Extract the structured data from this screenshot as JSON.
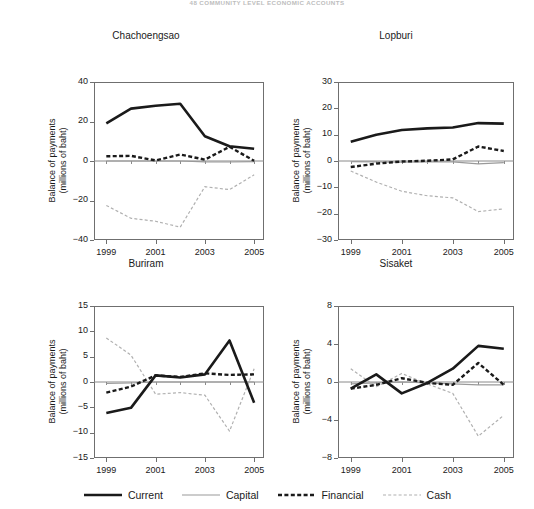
{
  "page": {
    "running_header": "48   COMMUNITY LEVEL ECONOMIC ACCOUNTS"
  },
  "legend": {
    "items": [
      {
        "label": "Current",
        "key": "current",
        "color": "#1a1a1a",
        "width": 2.6,
        "dash": "none",
        "name": "legend-item-current"
      },
      {
        "label": "Capital",
        "key": "capital",
        "color": "#9a9a9a",
        "width": 1.2,
        "dash": "none",
        "name": "legend-item-capital"
      },
      {
        "label": "Financial",
        "key": "financial",
        "color": "#1a1a1a",
        "width": 2.4,
        "dash": "4,2.4",
        "name": "legend-item-financial"
      },
      {
        "label": "Cash",
        "key": "cash",
        "color": "#b0b0b0",
        "width": 1.2,
        "dash": "3,2.2",
        "name": "legend-item-cash"
      }
    ]
  },
  "chart_data": [
    {
      "id": "chachoengsao",
      "type": "line",
      "title": "Chachoengsao",
      "xlabel": "",
      "ylabel": "Balance of payments\n(millions of baht)",
      "ylabel_line1": "Balance of payments",
      "ylabel_line2": "(millions of baht)",
      "x": [
        1999,
        2000,
        2001,
        2002,
        2003,
        2004,
        2005
      ],
      "xticks": [
        1999,
        2001,
        2003,
        2005
      ],
      "xlim": [
        1998.5,
        2005.4
      ],
      "ylim": [
        -40,
        40
      ],
      "yticks": [
        40,
        20,
        0,
        -20,
        -40
      ],
      "grid": false,
      "series": [
        {
          "name": "Current",
          "key": "current",
          "values": [
            19.0,
            26.5,
            28.0,
            29.0,
            12.5,
            7.5,
            6.2
          ]
        },
        {
          "name": "Capital",
          "key": "capital",
          "values": [
            0.0,
            0.0,
            0.0,
            0.0,
            -0.4,
            -0.5,
            -0.3
          ]
        },
        {
          "name": "Financial",
          "key": "financial",
          "values": [
            2.4,
            2.6,
            0.3,
            3.3,
            0.7,
            7.2,
            0.1
          ]
        },
        {
          "name": "Cash",
          "key": "cash",
          "values": [
            -22.5,
            -29.0,
            -30.5,
            -33.5,
            -13.0,
            -14.5,
            -7.0
          ]
        }
      ]
    },
    {
      "id": "lopburi",
      "type": "line",
      "title": "Lopburi",
      "xlabel": "",
      "ylabel": "Balance of payments\n(millions of baht)",
      "ylabel_line1": "Balance of payments",
      "ylabel_line2": "(millions of baht)",
      "x": [
        1999,
        2000,
        2001,
        2002,
        2003,
        2004,
        2005
      ],
      "xticks": [
        1999,
        2001,
        2003,
        2005
      ],
      "xlim": [
        1998.5,
        2005.4
      ],
      "ylim": [
        -30,
        30
      ],
      "yticks": [
        30,
        20,
        10,
        0,
        -10,
        -20,
        -30
      ],
      "grid": false,
      "series": [
        {
          "name": "Current",
          "key": "current",
          "values": [
            7.3,
            10.0,
            11.8,
            12.4,
            12.7,
            14.4,
            14.2
          ]
        },
        {
          "name": "Capital",
          "key": "capital",
          "values": [
            -0.2,
            -0.3,
            -0.4,
            -0.3,
            -0.3,
            -1.1,
            -0.6
          ]
        },
        {
          "name": "Financial",
          "key": "financial",
          "values": [
            -2.3,
            -1.0,
            -0.2,
            0.1,
            0.6,
            5.5,
            3.8
          ]
        },
        {
          "name": "Cash",
          "key": "cash",
          "values": [
            -3.8,
            -8.0,
            -11.5,
            -13.2,
            -14.0,
            -19.2,
            -18.2
          ]
        }
      ]
    },
    {
      "id": "buriram",
      "type": "line",
      "title": "Buriram",
      "xlabel": "",
      "ylabel": "Balance of payments\n(millions of baht)",
      "ylabel_line1": "Balance of payments",
      "ylabel_line2": "(millions of baht)",
      "x": [
        1999,
        2000,
        2001,
        2002,
        2003,
        2004,
        2005
      ],
      "xticks": [
        1999,
        2001,
        2003,
        2005
      ],
      "xlim": [
        1998.5,
        2005.4
      ],
      "ylim": [
        -15,
        15
      ],
      "yticks": [
        15,
        10,
        5,
        0,
        -5,
        -10,
        -15
      ],
      "grid": false,
      "series": [
        {
          "name": "Current",
          "key": "current",
          "values": [
            -6.1,
            -5.1,
            1.3,
            0.9,
            1.5,
            8.2,
            -4.1
          ]
        },
        {
          "name": "Capital",
          "key": "capital",
          "values": [
            -0.3,
            -0.2,
            0.0,
            0.0,
            0.0,
            0.0,
            0.0
          ]
        },
        {
          "name": "Financial",
          "key": "financial",
          "values": [
            -2.1,
            -0.9,
            1.3,
            1.0,
            1.7,
            1.4,
            1.5
          ]
        },
        {
          "name": "Cash",
          "key": "cash",
          "values": [
            8.7,
            5.3,
            -2.4,
            -2.1,
            -2.6,
            -9.7,
            2.6
          ]
        }
      ]
    },
    {
      "id": "sisaket",
      "type": "line",
      "title": "Sisaket",
      "xlabel": "",
      "ylabel": "Balance of payments\n(millions of baht)",
      "ylabel_line1": "Balance of payments",
      "ylabel_line2": "(millions of baht)",
      "x": [
        1999,
        2000,
        2001,
        2002,
        2003,
        2004,
        2005
      ],
      "xticks": [
        1999,
        2001,
        2003,
        2005
      ],
      "xlim": [
        1998.5,
        2005.4
      ],
      "ylim": [
        -8,
        8
      ],
      "yticks": [
        8,
        4,
        0,
        -4,
        -8
      ],
      "grid": false,
      "series": [
        {
          "name": "Current",
          "key": "current",
          "values": [
            -0.7,
            0.8,
            -1.2,
            -0.1,
            1.4,
            3.8,
            3.5
          ]
        },
        {
          "name": "Capital",
          "key": "capital",
          "values": [
            -0.2,
            -0.1,
            0.0,
            -0.1,
            -0.2,
            -0.3,
            -0.3
          ]
        },
        {
          "name": "Financial",
          "key": "financial",
          "values": [
            -0.7,
            -0.3,
            0.4,
            -0.1,
            -0.3,
            2.0,
            -0.3
          ]
        },
        {
          "name": "Cash",
          "key": "cash",
          "values": [
            1.4,
            -0.5,
            0.9,
            -0.2,
            -1.2,
            -5.7,
            -3.5
          ]
        }
      ]
    }
  ]
}
